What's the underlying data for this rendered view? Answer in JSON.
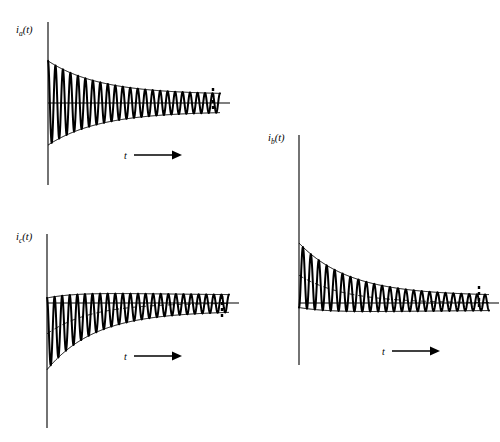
{
  "figure": {
    "title": "",
    "background_color": "#ffffff",
    "ink_color": "#000000"
  },
  "chart_data": {
    "type": "line",
    "title": "",
    "xlabel": "t",
    "ylabel": "",
    "grid": false,
    "legend": "none",
    "panels": [
      {
        "id": "ia",
        "name": "phase-a-current",
        "ylabel": "i_a(t)",
        "ylabel_base": "i",
        "ylabel_sub": "a",
        "ylabel_arg": "(t)",
        "xlabel": "t",
        "dc_offset_visible": false,
        "envelope_model": "symmetric decaying AC, no DC offset",
        "ac_initial_amplitude": 1.0,
        "ac_final_amplitude": 0.2,
        "ac_decay_tau": 0.3,
        "dc_initial": 0.0,
        "dc_decay_tau": 0.22,
        "cycles": 23,
        "phase_deg": 0,
        "plot_box": {
          "x": 48,
          "y": 22,
          "width": 172,
          "height": 163,
          "zero_y": 103
        }
      },
      {
        "id": "ib",
        "name": "phase-b-current",
        "ylabel": "i_b(t)",
        "ylabel_base": "i",
        "ylabel_sub": "b",
        "ylabel_arg": "(t)",
        "xlabel": "t",
        "dc_offset_visible": true,
        "envelope_model": "decaying AC plus positive decaying DC offset",
        "ac_initial_amplitude": 1.0,
        "ac_final_amplitude": 0.22,
        "ac_decay_tau": 0.3,
        "dc_initial": 0.86,
        "dc_decay_tau": 0.24,
        "cycles": 24,
        "phase_deg": 180,
        "plot_box": {
          "x": 299,
          "y": 135,
          "width": 190,
          "height": 230,
          "zero_y": 303
        }
      },
      {
        "id": "ic",
        "name": "phase-c-current",
        "ylabel": "i_c(t)",
        "ylabel_base": "i",
        "ylabel_sub": "c",
        "ylabel_arg": "(t)",
        "xlabel": "t",
        "dc_offset_visible": true,
        "envelope_model": "decaying AC plus negative decaying DC offset",
        "ac_initial_amplitude": 1.0,
        "ac_final_amplitude": 0.22,
        "ac_decay_tau": 0.3,
        "dc_initial": -0.86,
        "dc_decay_tau": 0.24,
        "cycles": 24,
        "phase_deg": 0,
        "plot_box": {
          "x": 47,
          "y": 234,
          "width": 182,
          "height": 194,
          "zero_y": 303
        }
      }
    ],
    "annotations": [
      {
        "id": "ia-t-arrow",
        "label": "t",
        "x": 127,
        "y": 156
      },
      {
        "id": "ic-t-arrow",
        "label": "t",
        "x": 127,
        "y": 357
      },
      {
        "id": "ib-t-arrow",
        "label": "t",
        "x": 385,
        "y": 352
      }
    ],
    "end_marks": [
      {
        "id": "ia-end-dashes",
        "x": 213,
        "y_top": 88,
        "y_bottom": 112
      },
      {
        "id": "ic-end-dashes",
        "x": 222,
        "y_top": 296,
        "y_bottom": 318
      },
      {
        "id": "ib-end-dashes",
        "x": 479,
        "y_top": 286,
        "y_bottom": 310
      }
    ]
  }
}
